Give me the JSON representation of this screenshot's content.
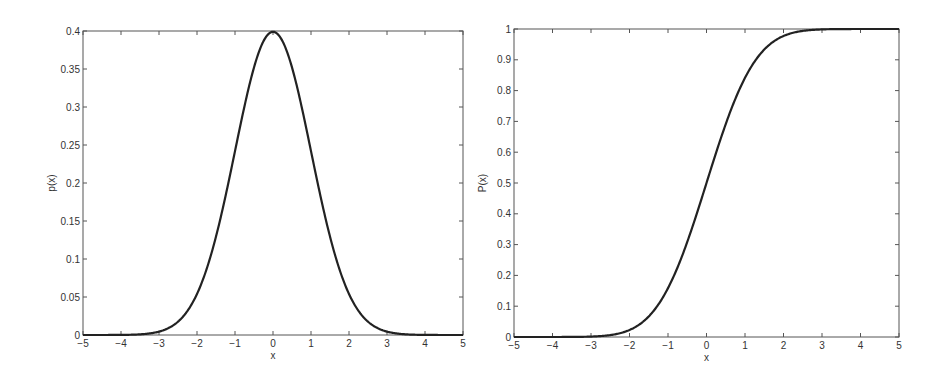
{
  "chart_data": [
    {
      "type": "line",
      "title": "",
      "xlabel": "x",
      "ylabel": "p(x)",
      "xlim": [
        -5,
        5
      ],
      "ylim": [
        0,
        0.4
      ],
      "xticks": [
        -5,
        -4,
        -3,
        -2,
        -1,
        0,
        1,
        2,
        3,
        4,
        5
      ],
      "yticks": [
        0,
        0.05,
        0.1,
        0.15,
        0.2,
        0.25,
        0.3,
        0.35,
        0.4
      ],
      "xtick_labels": [
        "-5",
        "-4",
        "-3",
        "-2",
        "-1",
        "0",
        "1",
        "2",
        "3",
        "4",
        "5"
      ],
      "ytick_labels": [
        "0",
        "0.05",
        "0.1",
        "0.15",
        "0.2",
        "0.25",
        "0.3",
        "0.35",
        "0.4"
      ],
      "grid": false,
      "legend": null,
      "series": [
        {
          "name": "standard normal pdf",
          "x": [
            -5,
            -4.5,
            -4,
            -3.5,
            -3,
            -2.5,
            -2,
            -1.5,
            -1,
            -0.5,
            0,
            0.5,
            1,
            1.5,
            2,
            2.5,
            3,
            3.5,
            4,
            4.5,
            5
          ],
          "values": [
            0.0,
            0.0,
            0.0001,
            0.0009,
            0.0044,
            0.0175,
            0.054,
            0.1295,
            0.242,
            0.3521,
            0.3989,
            0.3521,
            0.242,
            0.1295,
            0.054,
            0.0175,
            0.0044,
            0.0009,
            0.0001,
            0.0,
            0.0
          ]
        }
      ],
      "frame": {
        "left": 83,
        "top": 31,
        "right": 463,
        "bottom": 335
      }
    },
    {
      "type": "line",
      "title": "",
      "xlabel": "x",
      "ylabel": "P(x)",
      "xlim": [
        -5,
        5
      ],
      "ylim": [
        0,
        1
      ],
      "xticks": [
        -5,
        -4,
        -3,
        -2,
        -1,
        0,
        1,
        2,
        3,
        4,
        5
      ],
      "yticks": [
        0,
        0.1,
        0.2,
        0.3,
        0.4,
        0.5,
        0.6,
        0.7,
        0.8,
        0.9,
        1
      ],
      "xtick_labels": [
        "-5",
        "-4",
        "-3",
        "-2",
        "-1",
        "0",
        "1",
        "2",
        "3",
        "4",
        "5"
      ],
      "ytick_labels": [
        "0",
        "0.1",
        "0.2",
        "0.3",
        "0.4",
        "0.5",
        "0.6",
        "0.7",
        "0.8",
        "0.9",
        "1"
      ],
      "grid": false,
      "legend": null,
      "series": [
        {
          "name": "standard normal cdf",
          "x": [
            -5,
            -4.5,
            -4,
            -3.5,
            -3,
            -2.5,
            -2,
            -1.5,
            -1,
            -0.5,
            0,
            0.5,
            1,
            1.5,
            2,
            2.5,
            3,
            3.5,
            4,
            4.5,
            5
          ],
          "values": [
            0.0,
            0.0,
            0.0,
            0.0002,
            0.0013,
            0.0062,
            0.0228,
            0.0668,
            0.1587,
            0.3085,
            0.5,
            0.6915,
            0.8413,
            0.9332,
            0.9772,
            0.9938,
            0.9987,
            0.9998,
            1.0,
            1.0,
            1.0
          ]
        }
      ],
      "frame": {
        "left": 514,
        "top": 29,
        "right": 899,
        "bottom": 337
      }
    }
  ],
  "styles": {
    "axis_color": "#555555",
    "curve_color": "#222222",
    "background": "#ffffff"
  }
}
